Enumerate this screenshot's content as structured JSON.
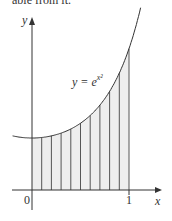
{
  "caption_text": "able from it.",
  "chart_data": {
    "type": "area",
    "title": "",
    "function_label": "y = e^{x^2}",
    "function_label_base": "y = e",
    "function_label_exp": "x²",
    "xlabel": "x",
    "ylabel": "y",
    "x_tick_labels": [
      "0",
      "1"
    ],
    "x_ticks": [
      0,
      1
    ],
    "xlim": [
      -0.1,
      1.15
    ],
    "ylim": [
      0,
      3.3
    ],
    "shaded_interval": [
      0,
      1
    ],
    "num_strips": 10,
    "strip_edges": [
      0,
      0.1,
      0.2,
      0.3,
      0.4,
      0.5,
      0.6,
      0.7,
      0.8,
      0.9,
      1.0
    ],
    "curve_samples": {
      "x": [
        0,
        0.1,
        0.2,
        0.3,
        0.4,
        0.5,
        0.6,
        0.7,
        0.8,
        0.9,
        1.0
      ],
      "y": [
        1.0,
        1.01,
        1.041,
        1.094,
        1.174,
        1.284,
        1.433,
        1.632,
        1.896,
        2.248,
        2.718
      ]
    },
    "grid": false,
    "legend": null
  },
  "colors": {
    "axis": "#333333",
    "curve": "#333333",
    "fill": "#eeeeee",
    "strip_lines": "#444444"
  }
}
